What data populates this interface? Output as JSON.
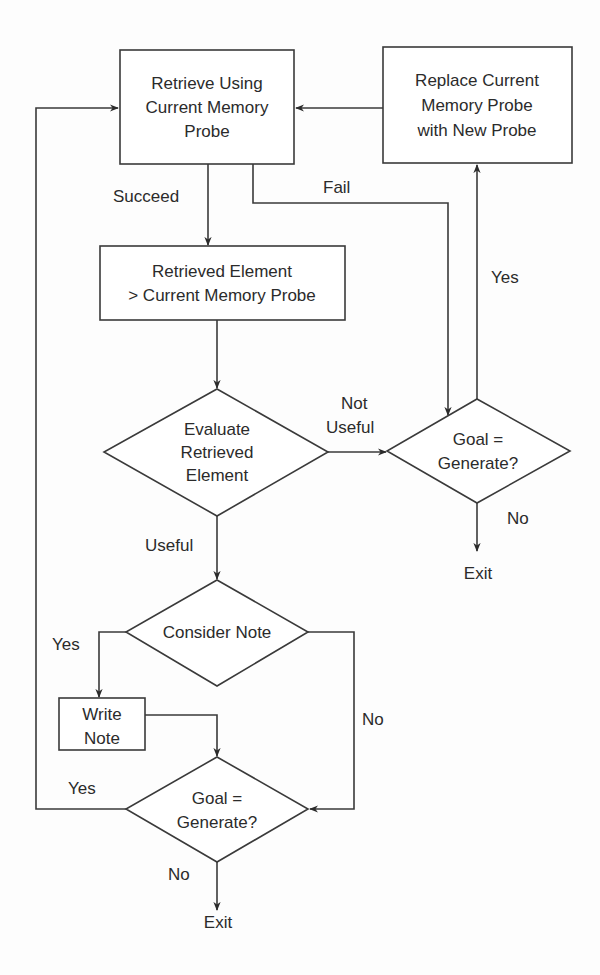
{
  "diagram": {
    "type": "flowchart",
    "colors": {
      "stroke": "#3a3a3a",
      "text": "#2b2b2b",
      "background": "#ffffff"
    },
    "nodes": {
      "retrieve": {
        "shape": "rectangle",
        "lines": [
          "Retrieve Using",
          "Current Memory",
          "Probe"
        ]
      },
      "replace": {
        "shape": "rectangle",
        "lines": [
          "Replace Current",
          "Memory Probe",
          "with New Probe"
        ]
      },
      "retrieved_element": {
        "shape": "rectangle",
        "lines": [
          "Retrieved Element",
          "> Current Memory Probe"
        ]
      },
      "evaluate": {
        "shape": "diamond",
        "lines": [
          "Evaluate",
          "Retrieved",
          "Element"
        ]
      },
      "goal_top": {
        "shape": "diamond",
        "lines": [
          "Goal =",
          "Generate?"
        ]
      },
      "exit_top": {
        "shape": "terminal-text",
        "lines": [
          "Exit"
        ]
      },
      "consider_note": {
        "shape": "diamond",
        "lines": [
          "Consider Note"
        ]
      },
      "write_note": {
        "shape": "rectangle",
        "lines": [
          "Write",
          "Note"
        ]
      },
      "goal_bottom": {
        "shape": "diamond",
        "lines": [
          "Goal =",
          "Generate?"
        ]
      },
      "exit_bottom": {
        "shape": "terminal-text",
        "lines": [
          "Exit"
        ]
      }
    },
    "edges": [
      {
        "from": "retrieve",
        "to": "retrieved_element",
        "label": "Succeed"
      },
      {
        "from": "retrieve",
        "to": "goal_top",
        "label": "Fail"
      },
      {
        "from": "replace",
        "to": "retrieve",
        "label": ""
      },
      {
        "from": "retrieved_element",
        "to": "evaluate",
        "label": ""
      },
      {
        "from": "evaluate",
        "to": "goal_top",
        "label": "Not Useful"
      },
      {
        "from": "evaluate",
        "to": "consider_note",
        "label": "Useful"
      },
      {
        "from": "goal_top",
        "to": "replace",
        "label": "Yes"
      },
      {
        "from": "goal_top",
        "to": "exit_top",
        "label": "No"
      },
      {
        "from": "consider_note",
        "to": "write_note",
        "label": "Yes"
      },
      {
        "from": "consider_note",
        "to": "goal_bottom",
        "label": "No"
      },
      {
        "from": "write_note",
        "to": "goal_bottom",
        "label": ""
      },
      {
        "from": "goal_bottom",
        "to": "retrieve",
        "label": "Yes"
      },
      {
        "from": "goal_bottom",
        "to": "exit_bottom",
        "label": "No"
      }
    ],
    "labels": {
      "succeed": "Succeed",
      "fail": "Fail",
      "not_useful_1": "Not",
      "not_useful_2": "Useful",
      "useful": "Useful",
      "yes_replace": "Yes",
      "no_top": "No",
      "yes_write": "Yes",
      "no_consider": "No",
      "yes_loop": "Yes",
      "no_bottom": "No"
    }
  }
}
